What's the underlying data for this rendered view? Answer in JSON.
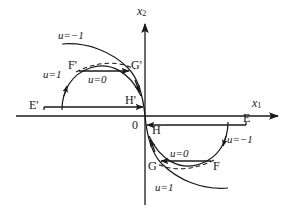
{
  "figure": {
    "type": "phase-plane-diagram",
    "title": "",
    "background_color": "#ffffff",
    "line_color": "#1a1a1a",
    "text_color": "#1a1a1a",
    "width": 294,
    "height": 211
  },
  "axes": {
    "horizontal": {
      "label": "x",
      "subscript": "1",
      "arrow": "right",
      "y_position": 116,
      "x_start": 16,
      "x_end": 285
    },
    "vertical": {
      "label": "x",
      "subscript": "2",
      "arrow": "up",
      "x_position": 145,
      "y_start": 18,
      "y_end": 205
    },
    "origin_label": "0"
  },
  "upper_left_branch": {
    "points": [
      {
        "name": "E-prime",
        "label": "E'"
      },
      {
        "name": "F-prime",
        "label": "F'"
      },
      {
        "name": "G-prime",
        "label": "G'"
      },
      {
        "name": "H-prime",
        "label": "H'"
      }
    ],
    "controls": [
      {
        "name": "control-u-minus-1-upper",
        "label": "u=−1"
      },
      {
        "name": "control-u-1-upper",
        "label": "u=1"
      },
      {
        "name": "control-u-0-upper",
        "label": "u=0"
      }
    ]
  },
  "lower_right_branch": {
    "points": [
      {
        "name": "E",
        "label": "E"
      },
      {
        "name": "F",
        "label": "F"
      },
      {
        "name": "G",
        "label": "G"
      },
      {
        "name": "H",
        "label": "H"
      }
    ],
    "controls": [
      {
        "name": "control-u-minus-1-lower",
        "label": "u=−1"
      },
      {
        "name": "control-u-0-lower",
        "label": "u=0"
      },
      {
        "name": "control-u-1-lower",
        "label": "u=1"
      }
    ]
  }
}
